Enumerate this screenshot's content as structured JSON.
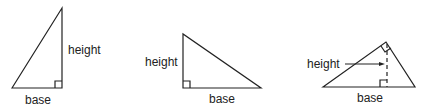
{
  "diagram": {
    "triangles": [
      {
        "id": "right-triangle-right-side",
        "height_label": "height",
        "base_label": "base"
      },
      {
        "id": "right-triangle-left-side",
        "height_label": "height",
        "base_label": "base"
      },
      {
        "id": "acute-triangle-altitude",
        "height_label": "height",
        "base_label": "base"
      }
    ],
    "colors": {
      "stroke": "#222222",
      "background": "#ffffff"
    }
  }
}
